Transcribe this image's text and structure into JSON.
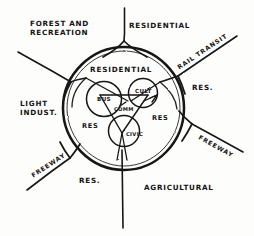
{
  "diagram": {
    "kind": "hand-drawn radial city land-use diagram",
    "ink_color": "#141414",
    "paper_color": "#fdfdfc",
    "core": {
      "title": "RESIDENTIAL",
      "inner_zone_left": "RES",
      "inner_zone_right": "RES",
      "nodes": [
        {
          "id": "business",
          "label": "BUS"
        },
        {
          "id": "cultural",
          "label": "CULT"
        },
        {
          "id": "commercial",
          "label": "COMM"
        },
        {
          "id": "civic",
          "label": "CIVIC"
        }
      ]
    },
    "outer_zones": [
      {
        "id": "forest-recreation",
        "line1": "FOREST AND",
        "line2": "RECREATION"
      },
      {
        "id": "residential-north",
        "line1": "RESIDENTIAL",
        "line2": ""
      },
      {
        "id": "residential-east",
        "line1": "RES.",
        "line2": ""
      },
      {
        "id": "light-industry",
        "line1": "LIGHT",
        "line2": "INDUST."
      },
      {
        "id": "residential-southwest",
        "line1": "RES.",
        "line2": ""
      },
      {
        "id": "agricultural",
        "line1": "AGRICULTURAL",
        "line2": ""
      }
    ],
    "corridors": [
      {
        "id": "rail-transit-northeast",
        "label": "RAIL TRANSIT"
      },
      {
        "id": "freeway-southeast",
        "label": "FREEWAY"
      },
      {
        "id": "freeway-southwest",
        "label": "FREEWAY"
      }
    ]
  }
}
